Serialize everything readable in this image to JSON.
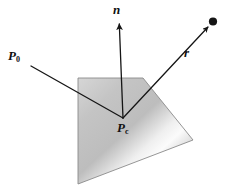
{
  "figure": {
    "background_color": "#ffffff",
    "width": 229,
    "height": 191
  },
  "labels": {
    "ray_origin": {
      "symbol": "P",
      "subscript": "0",
      "full": "P0"
    },
    "contact_point": {
      "symbol": "P",
      "subscript": "c",
      "full": "Pc"
    },
    "normal": {
      "symbol": "n",
      "subscript": "",
      "full": "n"
    },
    "reflection": {
      "symbol": "r",
      "subscript": "",
      "full": "r"
    }
  },
  "geometry": {
    "plane_polygon_points": "78,78 143,78 193,140 78,184",
    "plane_stroke_color": "#8a8a8a",
    "plane_fill_light": "#f4f4f4",
    "plane_fill_mid": "#c9c9c9",
    "plane_fill_dark": "#a8a8a8",
    "incident_ray": {
      "from_x": 31,
      "from_y": 66,
      "to_x": 123,
      "to_y": 118
    },
    "normal_vector": {
      "from_x": 123,
      "from_y": 118,
      "to_x": 119,
      "to_y": 22
    },
    "reflected_ray": {
      "from_x": 123,
      "from_y": 118,
      "to_x": 211,
      "to_y": 26
    },
    "endpoint_dot": {
      "cx": 213,
      "cy": 22,
      "r": 4
    },
    "vector_stroke_color": "#151515",
    "vector_stroke_width": 1.3
  },
  "elements": {
    "plane_name": "reflecting-plane",
    "incident_name": "incident-ray",
    "normal_name": "normal-vector",
    "reflected_name": "reflected-ray",
    "dot_name": "reflection-endpoint-dot"
  }
}
